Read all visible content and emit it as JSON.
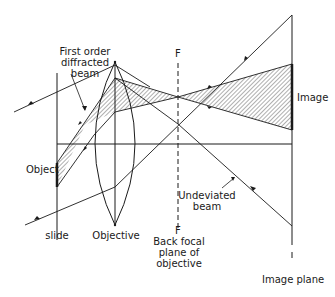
{
  "figure": {
    "labels": {
      "first_order_line1": "First order",
      "first_order_line2": "diffracted",
      "first_order_line3": "beam",
      "object": "Object",
      "slide": "slide",
      "objective": "Objective",
      "f_top": "F",
      "f_bottom": "F",
      "back_focal_line1": "Back focal",
      "back_focal_line2": "plane of",
      "back_focal_line3": "objective",
      "image": "Image",
      "undeviated_line1": "Undeviated",
      "undeviated_line2": "beam",
      "image_plane": "Image plane"
    },
    "colors": {
      "ink": "#1a1a1a",
      "background": "#ffffff"
    }
  }
}
